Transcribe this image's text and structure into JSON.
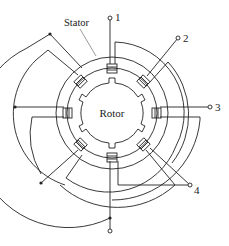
{
  "diagram": {
    "type": "stepper-motor-schematic",
    "labels": {
      "stator": "Stator",
      "rotor": "Rotor"
    },
    "terminals": [
      {
        "id": "1",
        "label": "1"
      },
      {
        "id": "2",
        "label": "2"
      },
      {
        "id": "3",
        "label": "3"
      },
      {
        "id": "4",
        "label": "4"
      },
      {
        "id": "common",
        "label": ""
      }
    ],
    "stator_poles": 8,
    "rotor_teeth": 6,
    "colors": {
      "line": "#222222",
      "background": "#ffffff"
    }
  }
}
